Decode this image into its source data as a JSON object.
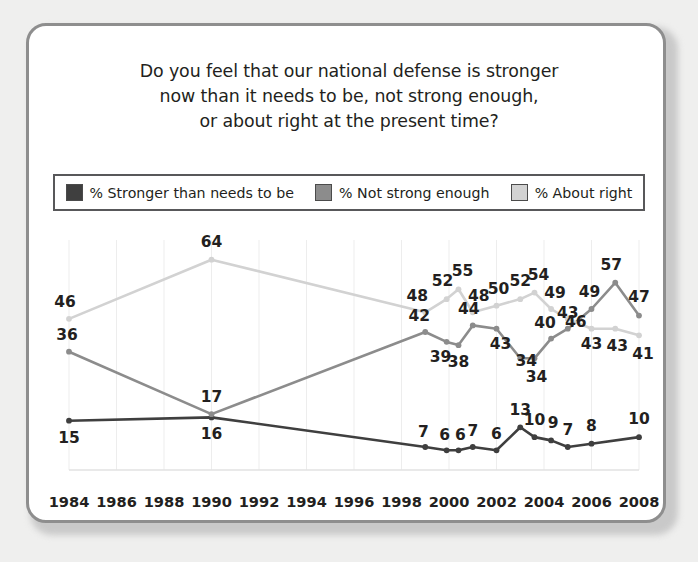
{
  "chart": {
    "title": "Do you feel that our national defense is stronger now than it needs to be, not strong enough, or about right at the present time?",
    "title_lines": [
      "Do you feel that our national defense is stronger",
      "now than it needs to be, not strong enough,",
      "or about right at the present time?"
    ]
  },
  "legend": {
    "items": [
      {
        "label": "% Stronger than needs to be",
        "color": "#3f3f3f",
        "name": "legend-item-stronger"
      },
      {
        "label": "% Not strong enough",
        "color": "#8c8c8c",
        "name": "legend-item-not-strong-enough"
      },
      {
        "label": "% About right",
        "color": "#d2d2d2",
        "name": "legend-item-about-right"
      }
    ]
  },
  "chart_data": {
    "type": "line",
    "title": "Do you feel that our national defense is stronger now than it needs to be, not strong enough, or about right at the present time?",
    "xlabel": "",
    "ylabel": "",
    "xlim": [
      1984,
      2008
    ],
    "ylim": [
      0,
      70
    ],
    "grid": "vertical",
    "legend_position": "top",
    "xticks": [
      1984,
      1986,
      1988,
      1990,
      1992,
      1994,
      1996,
      1998,
      2000,
      2002,
      2004,
      2006,
      2008
    ],
    "x": [
      1984,
      1990,
      1999.0,
      1999.9,
      2000.4,
      2001.0,
      2002.0,
      2003.0,
      2003.6,
      2004.3,
      2005.0,
      2006.0,
      2007.0,
      2008.0
    ],
    "series": [
      {
        "name": "% Stronger than needs to be",
        "color": "#3f3f3f",
        "values": [
          15,
          16,
          7,
          6,
          6,
          7,
          6,
          13,
          10,
          9,
          7,
          8,
          null,
          10
        ]
      },
      {
        "name": "% Not strong enough",
        "color": "#8c8c8c",
        "values": [
          36,
          17,
          42,
          39,
          38,
          44,
          43,
          34,
          34,
          40,
          43,
          49,
          57,
          47
        ]
      },
      {
        "name": "% About right",
        "color": "#d2d2d2",
        "values": [
          46,
          64,
          48,
          52,
          55,
          48,
          50,
          52,
          54,
          49,
          46,
          43,
          43,
          41
        ]
      }
    ],
    "point_labels": {
      "stronger": [
        "15",
        "16",
        "7",
        "6",
        "6",
        "7",
        "6",
        "13",
        "10",
        "9",
        "7",
        "8",
        "10"
      ],
      "not_strong_enough": [
        "36",
        "17",
        "42",
        "39",
        "38",
        "44",
        "43",
        "34",
        "34",
        "40",
        "43",
        "49",
        "57",
        "47"
      ],
      "about_right": [
        "46",
        "64",
        "48",
        "52",
        "55",
        "48",
        "50",
        "52",
        "54",
        "49",
        "46",
        "43",
        "43",
        "41"
      ]
    }
  },
  "axis": {
    "xticklabels": [
      "1984",
      "1986",
      "1988",
      "1990",
      "1992",
      "1994",
      "1996",
      "1998",
      "2000",
      "2002",
      "2004",
      "2006",
      "2008"
    ]
  }
}
